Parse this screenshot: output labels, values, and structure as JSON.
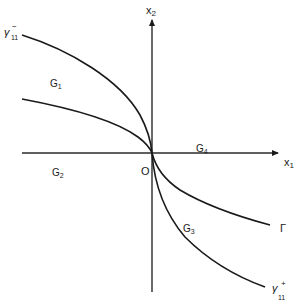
{
  "diagram": {
    "axes": {
      "x_label": "x",
      "x_sub": "1",
      "y_label": "x",
      "y_sub": "2",
      "origin_label": "O"
    },
    "regions": [
      {
        "id": "G1",
        "label": "G",
        "sub": "1"
      },
      {
        "id": "G2",
        "label": "G",
        "sub": "2"
      },
      {
        "id": "G3",
        "label": "G",
        "sub": "3"
      },
      {
        "id": "G4",
        "label": "G",
        "sub": "4"
      }
    ],
    "curves": {
      "gamma_minus": {
        "label": "γ",
        "sub": "11",
        "sup": "−"
      },
      "gamma_plus": {
        "label": "γ",
        "sub": "11",
        "sup": "+"
      },
      "Gamma": {
        "label": "Γ"
      }
    },
    "colors": {
      "ink": "#1a1a1a",
      "background": "#ffffff"
    }
  }
}
